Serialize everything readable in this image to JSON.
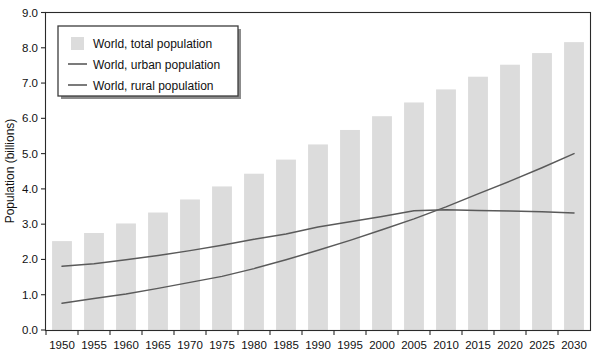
{
  "chart_data": {
    "type": "bar",
    "title": "",
    "xlabel": "",
    "ylabel": "Population (billions)",
    "ylim": [
      0.0,
      9.0
    ],
    "ytick_labels": [
      "0.0",
      "1.0",
      "2.0",
      "3.0",
      "4.0",
      "5.0",
      "6.0",
      "7.0",
      "8.0",
      "9.0"
    ],
    "ytick_values": [
      0,
      1,
      2,
      3,
      4,
      5,
      6,
      7,
      8,
      9
    ],
    "grid": false,
    "legend_position": "top-left",
    "categories": [
      "1950",
      "1955",
      "1960",
      "1965",
      "1970",
      "1975",
      "1980",
      "1985",
      "1990",
      "1995",
      "2000",
      "2005",
      "2010",
      "2015",
      "2020",
      "2025",
      "2030"
    ],
    "series": [
      {
        "name": "World, total population",
        "kind": "bar",
        "color": "#dcdcdc",
        "values": [
          2.52,
          2.75,
          3.02,
          3.33,
          3.7,
          4.07,
          4.43,
          4.83,
          5.26,
          5.67,
          6.06,
          6.45,
          6.82,
          7.18,
          7.52,
          7.85,
          8.16
        ]
      },
      {
        "name": "World, urban population",
        "kind": "line",
        "color": "#5a5a5a",
        "values": [
          0.76,
          0.89,
          1.02,
          1.18,
          1.35,
          1.52,
          1.74,
          1.99,
          2.26,
          2.54,
          2.84,
          3.15,
          3.49,
          3.86,
          4.22,
          4.6,
          5.0
        ]
      },
      {
        "name": "World, rural population",
        "kind": "line",
        "color": "#5a5a5a",
        "values": [
          1.81,
          1.88,
          1.99,
          2.11,
          2.25,
          2.4,
          2.57,
          2.72,
          2.92,
          3.07,
          3.22,
          3.38,
          3.41,
          3.39,
          3.37,
          3.35,
          3.32
        ]
      }
    ],
    "legend_entries": [
      {
        "label": "World, total population",
        "marker": "swatch"
      },
      {
        "label": "World, urban population",
        "marker": "line"
      },
      {
        "label": "World, rural population",
        "marker": "line"
      }
    ],
    "colors": {
      "bar": "#dcdcdc",
      "line": "#5a5a5a",
      "axis": "#2a2a2a",
      "background": "#ffffff"
    }
  }
}
